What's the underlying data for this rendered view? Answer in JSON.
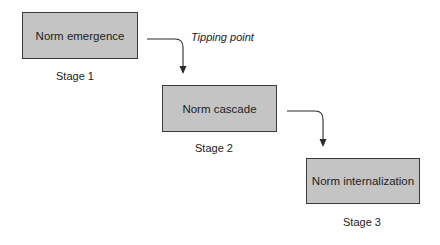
{
  "diagram": {
    "type": "process-flow",
    "stages": [
      {
        "label": "Norm emergence",
        "stage": "Stage 1"
      },
      {
        "label": "Norm cascade",
        "stage": "Stage 2"
      },
      {
        "label": "Norm internalization",
        "stage": "Stage 3"
      }
    ],
    "annotations": {
      "tipping_point": "Tipping point"
    },
    "colors": {
      "box_fill": "#c4c4c4",
      "box_border": "#3a3a3a",
      "arrow": "#2a2a2a"
    }
  }
}
